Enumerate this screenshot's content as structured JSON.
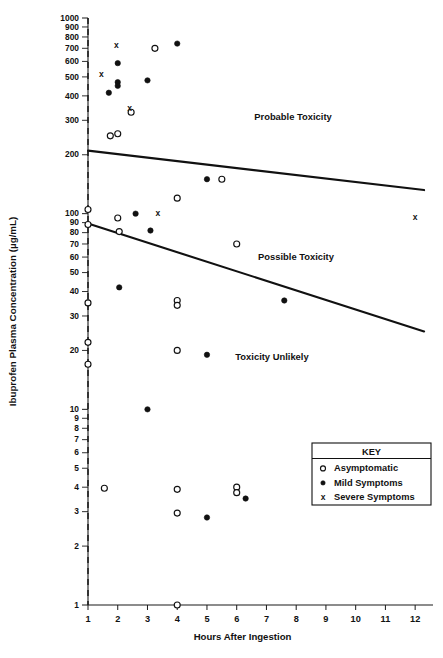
{
  "figure": {
    "name": "ibuprofen-toxicity-nomogram",
    "xlabel": "Hours After Ingestion",
    "ylabel": "Ibuprofen Plasma Concentration (µg/mL)"
  },
  "zones": [
    {
      "id": "probable",
      "label": "Probable Toxicity",
      "x": 293,
      "y": 120
    },
    {
      "id": "possible",
      "label": "Possible Toxicity",
      "x": 296,
      "y": 260
    },
    {
      "id": "unlikely",
      "label": "Toxicity Unlikely",
      "x": 272,
      "y": 360
    }
  ],
  "legend": {
    "title": "KEY",
    "items": [
      {
        "marker": "open-circle",
        "label": "Asymptomatic"
      },
      {
        "marker": "solid-circle",
        "label": "Mild Symptoms"
      },
      {
        "marker": "x-mark",
        "label": "Severe Symptoms"
      }
    ]
  },
  "chart_data": {
    "type": "scatter",
    "title": "",
    "xlabel": "Hours After Ingestion",
    "ylabel": "Ibuprofen Plasma Concentration (µg/mL)",
    "xscale": "linear",
    "yscale": "log",
    "xlim": [
      1,
      12.6
    ],
    "ylim": [
      1,
      1000
    ],
    "grid": false,
    "legend_position": "bottom-right",
    "xticks": [
      1,
      2,
      3,
      4,
      5,
      6,
      7,
      8,
      9,
      10,
      11,
      12
    ],
    "xtick_labels": [
      "1",
      "2",
      "3",
      "4",
      "5",
      "6",
      "7",
      "8",
      "9",
      "10",
      "11",
      "12"
    ],
    "yticks": [
      1,
      2,
      3,
      4,
      5,
      6,
      7,
      8,
      9,
      10,
      20,
      30,
      40,
      50,
      60,
      70,
      80,
      90,
      100,
      200,
      300,
      400,
      500,
      600,
      700,
      800,
      900,
      1000
    ],
    "ytick_labels": [
      "1",
      "2",
      "3",
      "4",
      "5",
      "6",
      "7",
      "8",
      "9",
      "10",
      "20",
      "30",
      "40",
      "50",
      "60",
      "70",
      "80",
      "90",
      "100",
      "200",
      "300",
      "400",
      "500",
      "600",
      "700",
      "800",
      "900",
      "1000"
    ],
    "reference_line": {
      "label": "1 hour",
      "x": 1,
      "style": "dashed"
    },
    "boundary_lines": [
      {
        "name": "probable-possible-boundary",
        "points": [
          [
            1,
            210
          ],
          [
            12.3,
            132
          ]
        ],
        "note": "upper nomogram line separating Probable Toxicity from Possible Toxicity"
      },
      {
        "name": "possible-unlikely-boundary",
        "points": [
          [
            1,
            89
          ],
          [
            12.3,
            25
          ]
        ],
        "note": "lower nomogram line separating Possible Toxicity from Toxicity Unlikely"
      }
    ],
    "series": [
      {
        "name": "Asymptomatic",
        "marker": "open-circle",
        "points": [
          [
            1.0,
            105
          ],
          [
            1.0,
            88
          ],
          [
            1.0,
            35
          ],
          [
            1.0,
            22
          ],
          [
            1.0,
            17
          ],
          [
            1.55,
            3.95
          ],
          [
            1.75,
            250
          ],
          [
            2.0,
            256
          ],
          [
            2.0,
            95
          ],
          [
            2.05,
            81
          ],
          [
            2.45,
            330
          ],
          [
            3.25,
            700
          ],
          [
            4.0,
            120
          ],
          [
            4.0,
            36
          ],
          [
            4.0,
            34
          ],
          [
            4.0,
            20
          ],
          [
            4.0,
            3.9
          ],
          [
            4.0,
            2.95
          ],
          [
            4.0,
            1.0
          ],
          [
            5.5,
            150
          ],
          [
            6.0,
            70
          ],
          [
            6.0,
            4.0
          ],
          [
            6.0,
            3.75
          ]
        ]
      },
      {
        "name": "Mild Symptoms",
        "marker": "solid-circle",
        "points": [
          [
            1.7,
            415
          ],
          [
            2.0,
            588
          ],
          [
            2.0,
            470
          ],
          [
            2.0,
            450
          ],
          [
            2.05,
            42
          ],
          [
            2.6,
            100
          ],
          [
            3.0,
            480
          ],
          [
            3.0,
            10.0
          ],
          [
            3.1,
            82
          ],
          [
            4.0,
            740
          ],
          [
            5.0,
            150
          ],
          [
            5.0,
            19
          ],
          [
            5.0,
            2.8
          ],
          [
            6.3,
            3.5
          ],
          [
            7.6,
            36
          ]
        ]
      },
      {
        "name": "Severe Symptoms",
        "marker": "x-mark",
        "points": [
          [
            1.45,
            510
          ],
          [
            1.95,
            720
          ],
          [
            2.4,
            345
          ],
          [
            3.35,
            100
          ],
          [
            12.0,
            95
          ]
        ]
      }
    ]
  }
}
